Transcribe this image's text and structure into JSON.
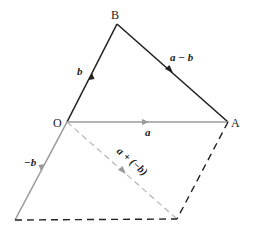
{
  "figure": {
    "points": {
      "O": {
        "label": "O",
        "x": 67,
        "y": 122
      },
      "A": {
        "label": "A",
        "x": 228,
        "y": 122
      },
      "B": {
        "label": "B",
        "x": 117,
        "y": 24
      },
      "C": {
        "label": "",
        "x": 15,
        "y": 220
      },
      "D": {
        "label": "",
        "x": 177,
        "y": 219
      }
    },
    "vectors": {
      "b": {
        "label": "b"
      },
      "a_minus_b": {
        "label": "a − b"
      },
      "a": {
        "label": "a"
      },
      "neg_b": {
        "label": "−b"
      },
      "a_plus_neg_b": {
        "label": "a + (−b)"
      }
    },
    "colors": {
      "dark": "#222222",
      "gray": "#9a9a9a",
      "dash_light": "#b5b5b5"
    }
  }
}
